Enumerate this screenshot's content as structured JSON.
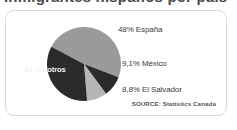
{
  "title_remnant": "Inmigrantes hispanos por país",
  "chart_data": {
    "type": "pie",
    "title": "",
    "categories": [
      "España",
      "México",
      "El Salvador",
      "otros"
    ],
    "values": [
      48,
      9.1,
      8.8,
      34.1
    ],
    "value_labels": [
      "48%",
      "9,1%",
      "8,8%",
      "34,1%"
    ],
    "labels": [
      "48% España",
      "9,1% México",
      "8,8% El Salvador",
      "34,1% otros"
    ],
    "colors": [
      "#9a9a9a",
      "#2b2b2b",
      "#b5b5b5",
      "#2b2b2b"
    ],
    "legend_position": "right",
    "grid": false,
    "source": "SOURCE: Statistics Canada"
  },
  "callouts": {
    "espana": "48% España",
    "mexico": "9,1% México",
    "el_salvador": "8,8% El Salvador",
    "otros": "34,1% otros"
  },
  "source": "SOURCE: Statistics Canada",
  "colors": {
    "slice_espana": "#9a9a9a",
    "slice_mexico": "#2b2b2b",
    "slice_el_salvador": "#b5b5b5",
    "slice_otros": "#2b2b2b",
    "card_border": "#d9d9d9",
    "text": "#3c3c3c",
    "inset_text": "#f2f2f2"
  }
}
